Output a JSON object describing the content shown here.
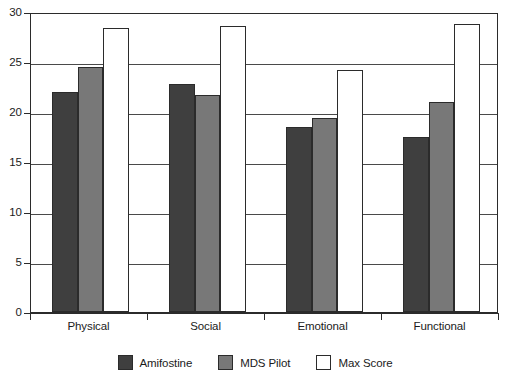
{
  "chart_data": {
    "type": "bar",
    "title": "",
    "subtitle": "",
    "xlabel": "",
    "ylabel": "",
    "categories": [
      "Physical",
      "Social",
      "Emotional",
      "Functional"
    ],
    "series": [
      {
        "name": "Amifostine",
        "color": "#3f3f3f",
        "values": [
          22.0,
          22.8,
          18.5,
          17.5
        ]
      },
      {
        "name": "MDS Pilot",
        "color": "#787878",
        "values": [
          24.5,
          21.7,
          19.4,
          21.0
        ]
      },
      {
        "name": "Max Score",
        "color": "#ffffff",
        "values": [
          28.4,
          28.6,
          24.2,
          28.8
        ]
      }
    ],
    "ylim": [
      0,
      30
    ],
    "yticks": [
      0,
      5,
      10,
      15,
      20,
      25,
      30
    ],
    "ytick_labels": [
      "0",
      "5",
      "10",
      "15",
      "20",
      "25",
      "30"
    ],
    "grid": true,
    "grid_axis": "y",
    "legend_position": "bottom",
    "legend_entries": [
      "Amifostine",
      "MDS Pilot",
      "Max Score"
    ],
    "bar_outline_color": "#2b2b2b",
    "axis_color": "#2b2b2b",
    "background_color": "#ffffff"
  }
}
